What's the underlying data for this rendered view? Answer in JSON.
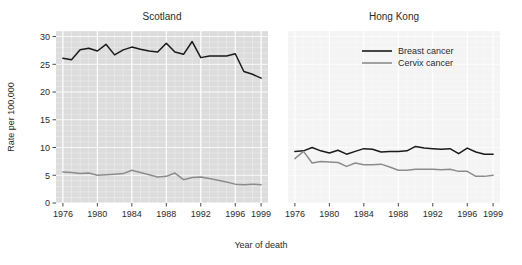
{
  "figure": {
    "xlabel": "Year of death",
    "ylabel": "Rate per 100,000"
  },
  "legend": {
    "items": [
      {
        "label": "Breast cancer",
        "color": "#1a1a1a"
      },
      {
        "label": "Cervix cancer",
        "color": "#8c8c8c"
      }
    ]
  },
  "chart_data": [
    {
      "type": "line",
      "title": "Scotland",
      "xlabel": "Year of death",
      "ylabel": "Rate per 100,000",
      "xlim": [
        1975.2,
        1999.8
      ],
      "ylim": [
        0,
        31
      ],
      "yticks": [
        0,
        5,
        10,
        15,
        20,
        25,
        30
      ],
      "xticks": [
        1976,
        1980,
        1984,
        1988,
        1992,
        1996,
        1999
      ],
      "xticklabels": [
        "1976",
        "1980",
        "1984",
        "1988",
        "1992",
        "1996",
        "1999"
      ],
      "grid": true,
      "panel_background": "#dcdcdc",
      "x": [
        1976,
        1977,
        1978,
        1979,
        1980,
        1981,
        1982,
        1983,
        1984,
        1985,
        1986,
        1987,
        1988,
        1989,
        1990,
        1991,
        1992,
        1993,
        1994,
        1995,
        1996,
        1997,
        1998,
        1999
      ],
      "series": [
        {
          "name": "Breast cancer",
          "color": "#1a1a1a",
          "values": [
            26.1,
            25.8,
            27.6,
            27.9,
            27.4,
            28.6,
            26.7,
            27.6,
            28.1,
            27.7,
            27.4,
            27.2,
            28.8,
            27.2,
            26.8,
            29.1,
            26.2,
            26.5,
            26.5,
            26.5,
            26.9,
            23.7,
            23.2,
            22.5
          ]
        },
        {
          "name": "Cervix cancer",
          "color": "#8c8c8c",
          "values": [
            5.6,
            5.5,
            5.3,
            5.4,
            5.0,
            5.1,
            5.2,
            5.3,
            5.9,
            5.5,
            5.1,
            4.7,
            4.8,
            5.4,
            4.2,
            4.6,
            4.7,
            4.4,
            4.1,
            3.8,
            3.4,
            3.3,
            3.4,
            3.3
          ]
        }
      ]
    },
    {
      "type": "line",
      "title": "Hong Kong",
      "xlabel": "Year of death",
      "ylabel": "Rate per 100,000",
      "xlim": [
        1975.2,
        1999.8
      ],
      "ylim": [
        0,
        31
      ],
      "yticks": [
        0,
        5,
        10,
        15,
        20,
        25,
        30
      ],
      "xticks": [
        1976,
        1980,
        1984,
        1988,
        1992,
        1996,
        1999
      ],
      "xticklabels": [
        "1976",
        "1980",
        "1984",
        "1988",
        "1992",
        "1996",
        "1999"
      ],
      "grid": true,
      "panel_background": "#f4f4f4",
      "x": [
        1976,
        1977,
        1978,
        1979,
        1980,
        1981,
        1982,
        1983,
        1984,
        1985,
        1986,
        1987,
        1988,
        1989,
        1990,
        1991,
        1992,
        1993,
        1994,
        1995,
        1996,
        1997,
        1998,
        1999
      ],
      "series": [
        {
          "name": "Breast cancer",
          "color": "#1a1a1a",
          "values": [
            9.3,
            9.4,
            10.0,
            9.4,
            9.0,
            9.5,
            8.8,
            9.3,
            9.8,
            9.7,
            9.2,
            9.3,
            9.3,
            9.4,
            10.2,
            9.9,
            9.8,
            9.7,
            9.8,
            8.9,
            9.9,
            9.2,
            8.8,
            8.8
          ]
        },
        {
          "name": "Cervix cancer",
          "color": "#8c8c8c",
          "values": [
            8.0,
            9.3,
            7.2,
            7.5,
            7.4,
            7.3,
            6.6,
            7.2,
            6.9,
            6.9,
            7.0,
            6.5,
            5.9,
            5.9,
            6.1,
            6.1,
            6.1,
            6.0,
            6.1,
            5.7,
            5.7,
            4.8,
            4.8,
            5.0
          ]
        }
      ]
    }
  ]
}
